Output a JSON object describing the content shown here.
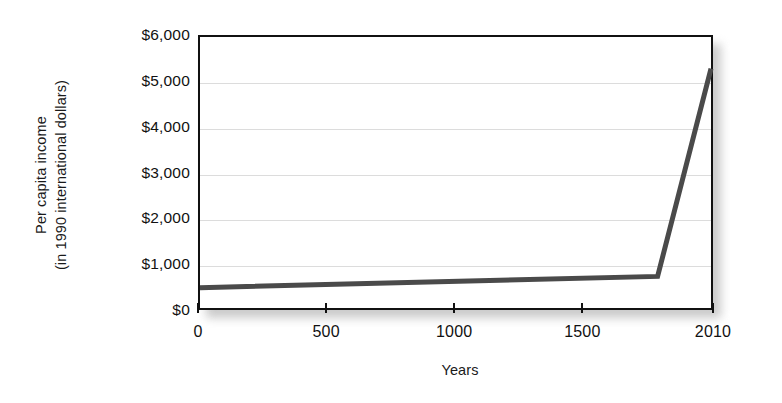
{
  "chart_data": {
    "type": "line",
    "title": "",
    "xlabel": "Years",
    "ylabel": "Per capita income (in 1990 international dollars)",
    "ylabel_line1": "Per capita income",
    "ylabel_line2": "(in 1990 international dollars)",
    "x": [
      0,
      1800,
      2010
    ],
    "values": [
      450,
      700,
      5300
    ],
    "series": [
      {
        "name": "Per capita income",
        "x": [
          0,
          1800,
          2010
        ],
        "values": [
          450,
          700,
          5300
        ],
        "color": "#4a4a4a"
      }
    ],
    "xlim": [
      0,
      2010
    ],
    "ylim": [
      0,
      6000
    ],
    "xticks": [
      0,
      500,
      1000,
      1500,
      2010
    ],
    "xticklabels": [
      "0",
      "500",
      "1000",
      "1500",
      "2010"
    ],
    "yticks": [
      0,
      1000,
      2000,
      3000,
      4000,
      5000,
      6000
    ],
    "yticklabels": [
      "$0",
      "$1,000",
      "$2,000",
      "$3,000",
      "$4,000",
      "$5,000",
      "$6,000"
    ],
    "grid": "horizontal",
    "gridcolor": "#dcdcdc",
    "legend": "none",
    "frame_color": "#111111",
    "background": "#ffffff"
  }
}
